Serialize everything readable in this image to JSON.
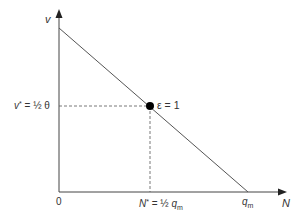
{
  "diagram": {
    "axes": {
      "y_label": "v",
      "x_label": "N",
      "origin_label": "0"
    },
    "line": {
      "y_intercept_label": "θ",
      "x_intercept_label_main": "q",
      "x_intercept_label_sub": "m"
    },
    "point": {
      "label": "ε = 1",
      "v_star_label_main": "v",
      "v_star_sup": "*",
      "v_star_value": "= ½ θ",
      "n_star_label_main": "N",
      "n_star_sup": "*",
      "n_star_value": "= ½ ",
      "n_star_q": "q",
      "n_star_sub": "m"
    },
    "colors": {
      "axis": "#444444",
      "line": "#555555",
      "point": "#000000",
      "guide": "#555555"
    }
  }
}
